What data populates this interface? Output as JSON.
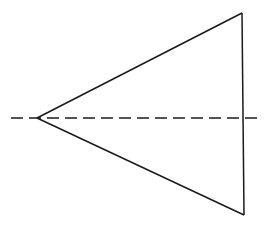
{
  "figure": {
    "background_color": "#ffffff",
    "width": 268,
    "height": 228,
    "stroke_color": "#1a1a1a",
    "shapes": {
      "triangle": {
        "name": "isosceles-triangle",
        "apex": {
          "x": 37,
          "y": 118
        },
        "top_right": {
          "x": 242,
          "y": 13
        },
        "bottom_right": {
          "x": 244,
          "y": 215
        },
        "points": "37,118 242,13 244,215",
        "stroke_color": "#1a1a1a",
        "stroke_width": 1.5,
        "fill": "none",
        "style": "solid"
      },
      "upper_edge": {
        "name": "upper-slanted-edge",
        "x1": 37,
        "y1": 118,
        "x2": 242,
        "y2": 13,
        "style": "solid"
      },
      "lower_edge": {
        "name": "lower-slanted-edge",
        "x1": 37,
        "y1": 118,
        "x2": 244,
        "y2": 215,
        "style": "solid"
      },
      "right_edge": {
        "name": "right-vertical-edge",
        "x1": 242,
        "y1": 13,
        "x2": 244,
        "y2": 215,
        "style": "solid"
      },
      "axis": {
        "name": "axis-of-symmetry",
        "x1": 11,
        "y1": 118,
        "x2": 262,
        "y2": 118,
        "stroke_color": "#1a1a1a",
        "stroke_width": 1.5,
        "style": "dashed",
        "dash_length": 12,
        "gap_length": 6,
        "dash_array": "12 6"
      }
    }
  }
}
